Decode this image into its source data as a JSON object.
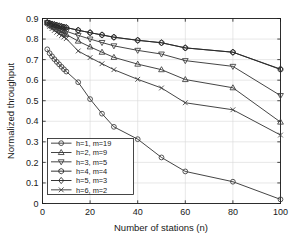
{
  "chart_data": {
    "type": "line",
    "title": "",
    "xlabel": "Number of stations (n)",
    "ylabel": "Normalized throughput",
    "xlim": [
      0,
      100
    ],
    "ylim": [
      0,
      0.9
    ],
    "xticks": [
      0,
      20,
      40,
      60,
      80,
      100
    ],
    "xtick_labels": [
      "0",
      "20",
      "40",
      "60",
      "80",
      "100"
    ],
    "yticks": [
      0,
      0.1,
      0.2,
      0.3,
      0.4,
      0.5,
      0.6,
      0.7,
      0.8,
      0.9
    ],
    "ytick_labels": [
      "0",
      "0.1",
      "0.2",
      "0.3",
      "0.4",
      "0.5",
      "0.6",
      "0.7",
      "0.8",
      "0.9"
    ],
    "grid": true,
    "legend_position": "lower left",
    "series": [
      {
        "name": "h=1, m=19",
        "marker": "circle",
        "color": "#3b3b3b",
        "x": [
          2,
          3,
          4,
          5,
          6,
          7,
          8,
          9,
          10,
          15,
          20,
          25,
          30,
          40,
          50,
          60,
          80,
          100
        ],
        "y": [
          0.75,
          0.731,
          0.716,
          0.702,
          0.689,
          0.677,
          0.665,
          0.653,
          0.642,
          0.59,
          0.508,
          0.437,
          0.373,
          0.313,
          0.224,
          0.156,
          0.106,
          0.047
        ]
      },
      {
        "name": "h=2, m=9",
        "marker": "triangle-up",
        "color": "#3b3b3b",
        "x": [
          2,
          3,
          4,
          5,
          6,
          7,
          8,
          9,
          10,
          15,
          20,
          25,
          30,
          40,
          50,
          60,
          80,
          100
        ],
        "y": [
          0.88,
          0.869,
          0.862,
          0.855,
          0.848,
          0.841,
          0.834,
          0.828,
          0.822,
          0.79,
          0.762,
          0.736,
          0.711,
          0.678,
          0.651,
          0.603,
          0.563,
          0.528
        ]
      },
      {
        "name": "h=3, m=5",
        "marker": "triangle-down",
        "color": "#3b3b3b",
        "x": [
          2,
          3,
          4,
          5,
          6,
          7,
          8,
          9,
          10,
          15,
          20,
          25,
          30,
          40,
          50,
          60,
          80,
          100
        ],
        "y": [
          0.88,
          0.872,
          0.866,
          0.861,
          0.856,
          0.851,
          0.846,
          0.842,
          0.838,
          0.818,
          0.8,
          0.783,
          0.767,
          0.745,
          0.727,
          0.695,
          0.667,
          0.636
        ]
      },
      {
        "name": "h=4, m=4",
        "marker": "hexagon",
        "color": "#2a2a2a",
        "x": [
          2,
          3,
          4,
          5,
          6,
          7,
          8,
          9,
          10,
          15,
          20,
          25,
          30,
          40,
          50,
          60,
          80,
          100
        ],
        "y": [
          0.88,
          0.876,
          0.873,
          0.87,
          0.867,
          0.864,
          0.861,
          0.858,
          0.856,
          0.843,
          0.831,
          0.82,
          0.809,
          0.794,
          0.782,
          0.757,
          0.736,
          0.714
        ]
      },
      {
        "name": "h=5, m=3",
        "marker": "diamond",
        "color": "#2a2a2a",
        "x": [
          2,
          3,
          4,
          5,
          6,
          7,
          8,
          9,
          10,
          15,
          20,
          25,
          30,
          40,
          50,
          60,
          80,
          100
        ],
        "y": [
          0.88,
          0.876,
          0.873,
          0.87,
          0.867,
          0.864,
          0.861,
          0.858,
          0.856,
          0.843,
          0.831,
          0.82,
          0.809,
          0.794,
          0.782,
          0.757,
          0.736,
          0.714
        ]
      },
      {
        "name": "h=6, m=2",
        "marker": "x-cross",
        "color": "#3b3b3b",
        "x": [
          2,
          3,
          4,
          5,
          6,
          7,
          8,
          9,
          10,
          15,
          20,
          25,
          30,
          40,
          50,
          60,
          80,
          100
        ],
        "y": [
          0.875,
          0.862,
          0.851,
          0.842,
          0.833,
          0.825,
          0.817,
          0.81,
          0.802,
          0.742,
          0.71,
          0.68,
          0.651,
          0.604,
          0.562,
          0.49,
          0.456,
          0.402
        ]
      }
    ],
    "series_100_endpoints": {
      "h=1, m=19": 0.02,
      "h=2, m=9": 0.396,
      "h=3, m=5": 0.525,
      "h=4, m=4": 0.652,
      "h=5, m=3": 0.654,
      "h=6, m=2": 0.333
    },
    "colors": {
      "axis": "#1a1a1a",
      "grid": "#d6d6d6",
      "background": "#ffffff",
      "line": "#3b3b3b"
    },
    "legend_entries": [
      "h=1, m=19",
      "h=2, m=9",
      "h=3, m=5",
      "h=4, m=4",
      "h=5, m=3",
      "h=6, m=2"
    ]
  }
}
